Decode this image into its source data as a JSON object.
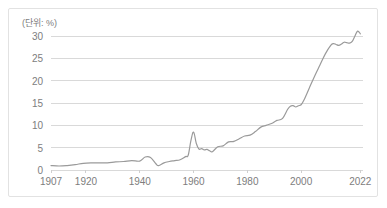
{
  "chart": {
    "title": "(단위: %)",
    "unit_note": "(단위: %)"
  },
  "chart_data": {
    "type": "line",
    "title": "(단위: %)",
    "xlabel": "",
    "ylabel": "",
    "xlim": [
      1907,
      2023
    ],
    "ylim": [
      0,
      30
    ],
    "grid": true,
    "legend": null,
    "y_ticks": [
      "0",
      "5",
      "10",
      "15",
      "20",
      "25",
      "30"
    ],
    "y_tick_values": [
      0,
      5,
      10,
      15,
      20,
      25,
      30
    ],
    "x_ticks": [
      "1907",
      "1920",
      "1940",
      "1960",
      "1980",
      "2000",
      "2022"
    ],
    "x_tick_values": [
      1907,
      1920,
      1940,
      1960,
      1980,
      2000,
      2022
    ],
    "line_color": "#9a9a9a",
    "grid_color": "#d9d9d9",
    "series": [
      {
        "name": "",
        "color": "#9a9a9a",
        "x": [
          1907,
          1910,
          1913,
          1916,
          1919,
          1922,
          1925,
          1928,
          1931,
          1934,
          1937,
          1940,
          1942,
          1944,
          1946,
          1947,
          1949,
          1951,
          1953,
          1955,
          1957,
          1958,
          1959,
          1960,
          1961,
          1962,
          1963,
          1964,
          1965,
          1966,
          1967,
          1969,
          1971,
          1973,
          1975,
          1977,
          1979,
          1981,
          1983,
          1985,
          1987,
          1989,
          1991,
          1993,
          1995,
          1996,
          1997,
          1998,
          1999,
          2000,
          2001,
          2003,
          2005,
          2007,
          2009,
          2011,
          2012,
          2013,
          2014,
          2015,
          2016,
          2017,
          2018,
          2019,
          2020,
          2021,
          2022
        ],
        "values": [
          1.0,
          0.9,
          1.0,
          1.2,
          1.5,
          1.6,
          1.6,
          1.6,
          1.8,
          1.9,
          2.1,
          2.0,
          2.9,
          2.8,
          1.4,
          1.0,
          1.6,
          1.9,
          2.1,
          2.3,
          3.0,
          3.3,
          6.5,
          8.5,
          6.0,
          4.7,
          4.8,
          4.5,
          4.6,
          4.3,
          4.1,
          5.2,
          5.4,
          6.3,
          6.4,
          7.0,
          7.6,
          7.8,
          8.6,
          9.6,
          10.0,
          10.4,
          11.1,
          11.5,
          13.6,
          14.3,
          14.4,
          14.1,
          14.4,
          14.6,
          15.6,
          18.3,
          21.0,
          23.5,
          26.0,
          27.9,
          28.3,
          28.1,
          27.9,
          28.2,
          28.6,
          28.5,
          28.4,
          28.8,
          30.0,
          31.1,
          30.5
        ]
      }
    ]
  }
}
